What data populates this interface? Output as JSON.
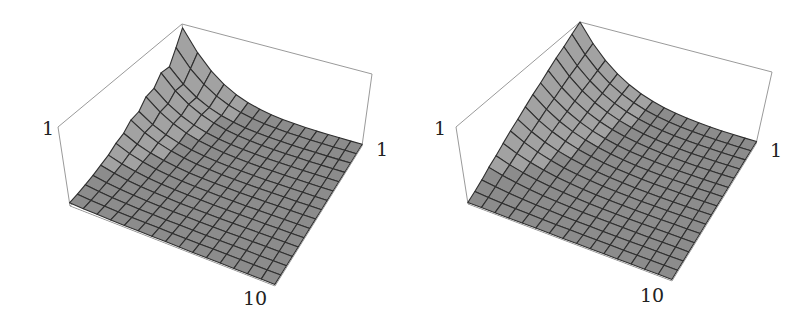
{
  "chart_data": [
    {
      "type": "surface3d",
      "title": "",
      "grid_cells": 15,
      "axis_labels": {
        "z_tick": "1",
        "y_tick": "1",
        "x_tick": "10"
      },
      "zlim": [
        0,
        1
      ],
      "description": "Surface with a noisy ridge along the left wall peaking (~0.95) at the back corner and decaying rapidly toward the right wall",
      "ridge_profile": [
        0.95,
        0.78,
        0.62,
        0.63,
        0.52,
        0.5,
        0.4,
        0.38,
        0.3,
        0.26,
        0.2,
        0.16,
        0.12,
        0.09,
        0.06,
        0.04
      ],
      "decay_rate": 5.5,
      "floor_level": 0.02,
      "box": {
        "floor": {
          "back": [
            192,
            100
          ],
          "left": [
            70,
            206
          ],
          "front": [
            275,
            286
          ],
          "right": [
            362,
            146
          ]
        },
        "top": {
          "back": [
            182,
            24
          ],
          "left": [
            58,
            127
          ],
          "front": [
            270,
            208
          ],
          "right": [
            372,
            74
          ]
        }
      },
      "label_pos": {
        "z_tick": [
          42,
          135
        ],
        "y_tick": [
          376,
          156
        ],
        "x_tick": [
          243,
          305
        ]
      }
    },
    {
      "type": "surface3d",
      "title": "",
      "grid_cells": 15,
      "axis_labels": {
        "z_tick": "1",
        "y_tick": "1",
        "x_tick": "10"
      },
      "zlim": [
        0,
        1
      ],
      "description": "Smooth surface: linear ridge along the left wall from 1 at back corner to ~0 at left, exponential decay toward right wall",
      "ridge_profile": [
        1.0,
        0.93,
        0.86,
        0.8,
        0.73,
        0.66,
        0.6,
        0.53,
        0.46,
        0.4,
        0.33,
        0.26,
        0.2,
        0.13,
        0.07,
        0.02
      ],
      "decay_rate": 4.2,
      "floor_level": 0.02,
      "box": {
        "floor": {
          "back": [
            582,
            98
          ],
          "left": [
            468,
            204
          ],
          "front": [
            672,
            281
          ],
          "right": [
            756,
            144
          ]
        },
        "top": {
          "back": [
            580,
            22
          ],
          "left": [
            456,
            127
          ],
          "front": [
            668,
            204
          ],
          "right": [
            772,
            72
          ]
        }
      },
      "label_pos": {
        "z_tick": [
          434,
          135
        ],
        "y_tick": [
          770,
          157
        ],
        "x_tick": [
          640,
          302
        ]
      }
    }
  ],
  "colors": {
    "surface": "#8c8c8c",
    "surface_light": "#a2a2a2",
    "mesh": "#2f2f2f",
    "box": "#9a9a9a",
    "text": "#222222"
  }
}
